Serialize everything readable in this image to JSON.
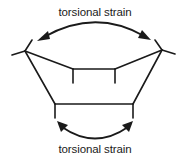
{
  "diagram": {
    "labels": {
      "top": "torsional strain",
      "bottom": "torsional strain"
    },
    "colors": {
      "stroke": "#1a1a1a",
      "background": "#ffffff"
    },
    "annotations": [
      {
        "name": "top-arrow",
        "type": "double-headed-curved-arrow",
        "label": "torsional strain"
      },
      {
        "name": "bottom-arrow",
        "type": "double-headed-curved-arrow",
        "label": "torsional strain"
      }
    ]
  }
}
